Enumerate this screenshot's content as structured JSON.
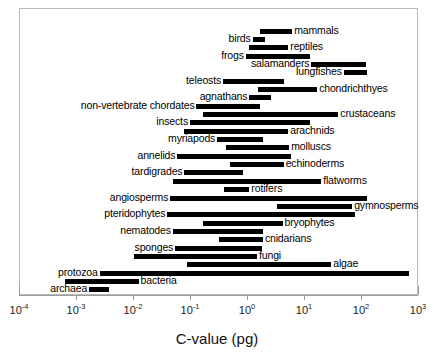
{
  "chart_data": {
    "type": "bar",
    "orientation": "horizontal-range",
    "title": "",
    "xlabel": "C-value (pg)",
    "ylabel": "",
    "xscale": "log",
    "xlim": [
      0.0001,
      1000
    ],
    "grid": false,
    "legend": null,
    "tick_labels": [
      "10-4",
      "10-3",
      "10-2",
      "10-1",
      "100",
      "101",
      "102",
      "103"
    ],
    "tick_mantissas": [
      "10",
      "10",
      "10",
      "10",
      "10",
      "10",
      "10",
      "10"
    ],
    "tick_exponents": [
      "-4",
      "-3",
      "-2",
      "-1",
      "0",
      "1",
      "2",
      "3"
    ],
    "tick_values": [
      0.0001,
      0.001,
      0.01,
      0.1,
      1,
      10,
      100,
      1000
    ],
    "value_unit": "pg",
    "categories": [
      "mammals",
      "birds",
      "reptiles",
      "frogs",
      "salamanders",
      "lungfishes",
      "teleosts",
      "chondrichthyes",
      "agnathans",
      "non-vertebrate chordates",
      "crustaceans",
      "insects",
      "arachnids",
      "myriapods",
      "molluscs",
      "annelids",
      "echinoderms",
      "tardigrades",
      "flatworms",
      "rotifers",
      "angiosperms",
      "gymnosperms",
      "pteridophytes",
      "bryophytes",
      "nematodes",
      "cnidarians",
      "sponges",
      "fungi",
      "algae",
      "protozoa",
      "bacteria",
      "archaea"
    ],
    "ranges": [
      {
        "name": "mammals",
        "min": 1.7,
        "max": 6.2,
        "label_side": "right"
      },
      {
        "name": "birds",
        "min": 1.25,
        "max": 2.1,
        "label_side": "left"
      },
      {
        "name": "reptiles",
        "min": 1.1,
        "max": 5.3,
        "label_side": "right"
      },
      {
        "name": "frogs",
        "min": 0.95,
        "max": 13.0,
        "label_side": "left"
      },
      {
        "name": "salamanders",
        "min": 13.5,
        "max": 120.0,
        "label_side": "left"
      },
      {
        "name": "lungfishes",
        "min": 50.0,
        "max": 130.0,
        "label_side": "left"
      },
      {
        "name": "teleosts",
        "min": 0.38,
        "max": 4.5,
        "label_side": "left"
      },
      {
        "name": "chondrichthyes",
        "min": 1.55,
        "max": 17.0,
        "label_side": "right"
      },
      {
        "name": "agnathans",
        "min": 1.1,
        "max": 2.6,
        "label_side": "left"
      },
      {
        "name": "non-vertebrate chordates",
        "min": 0.13,
        "max": 1.7,
        "label_side": "left"
      },
      {
        "name": "crustaceans",
        "min": 0.17,
        "max": 40.0,
        "label_side": "right"
      },
      {
        "name": "insects",
        "min": 0.1,
        "max": 13.0,
        "label_side": "left"
      },
      {
        "name": "arachnids",
        "min": 0.08,
        "max": 5.3,
        "label_side": "right"
      },
      {
        "name": "myriapods",
        "min": 0.3,
        "max": 1.9,
        "label_side": "left"
      },
      {
        "name": "molluscs",
        "min": 0.42,
        "max": 5.5,
        "label_side": "right"
      },
      {
        "name": "annelids",
        "min": 0.06,
        "max": 6.0,
        "label_side": "left"
      },
      {
        "name": "echinoderms",
        "min": 0.5,
        "max": 4.4,
        "label_side": "right"
      },
      {
        "name": "tardigrades",
        "min": 0.08,
        "max": 0.85,
        "label_side": "left"
      },
      {
        "name": "flatworms",
        "min": 0.05,
        "max": 20.0,
        "label_side": "right"
      },
      {
        "name": "rotifers",
        "min": 0.4,
        "max": 1.1,
        "label_side": "right"
      },
      {
        "name": "angiosperms",
        "min": 0.045,
        "max": 125.0,
        "label_side": "left"
      },
      {
        "name": "gymnosperms",
        "min": 3.3,
        "max": 70.0,
        "label_side": "right"
      },
      {
        "name": "pteridophytes",
        "min": 0.04,
        "max": 80.0,
        "label_side": "left"
      },
      {
        "name": "bryophytes",
        "min": 0.17,
        "max": 4.2,
        "label_side": "right"
      },
      {
        "name": "nematodes",
        "min": 0.05,
        "max": 1.9,
        "label_side": "left"
      },
      {
        "name": "cnidarians",
        "min": 0.32,
        "max": 1.9,
        "label_side": "right"
      },
      {
        "name": "sponges",
        "min": 0.055,
        "max": 1.8,
        "label_side": "left"
      },
      {
        "name": "fungi",
        "min": 0.0105,
        "max": 1.5,
        "label_side": "right"
      },
      {
        "name": "algae",
        "min": 0.09,
        "max": 30.0,
        "label_side": "right"
      },
      {
        "name": "protozoa",
        "min": 0.0026,
        "max": 700.0,
        "label_side": "left"
      },
      {
        "name": "bacteria",
        "min": 0.00065,
        "max": 0.0125,
        "label_side": "right"
      },
      {
        "name": "archaea",
        "min": 0.0017,
        "max": 0.0038,
        "label_side": "left"
      }
    ]
  },
  "axis": {
    "title": "C-value (pg)"
  },
  "caption": {
    "text": ""
  }
}
